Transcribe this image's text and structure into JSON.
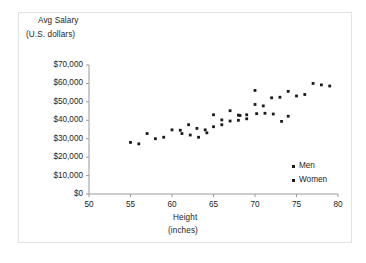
{
  "chart_data": {
    "type": "scatter",
    "title": "",
    "ylabel_line1": "Avg Salary",
    "ylabel_line2": "(U.S. dollars)",
    "xlabel_line1": "Height",
    "xlabel_line2": "(inches)",
    "xlim": [
      50,
      80
    ],
    "ylim": [
      0,
      70000
    ],
    "xticks": [
      50,
      55,
      60,
      65,
      70,
      75,
      80
    ],
    "xtick_labels": [
      "50",
      "55",
      "60",
      "65",
      "70",
      "75",
      "80"
    ],
    "yticks": [
      0,
      10000,
      20000,
      30000,
      40000,
      50000,
      60000,
      70000
    ],
    "ytick_labels": [
      "$0",
      "$10,000",
      "$20,000",
      "$30,000",
      "$40,000",
      "$50,000",
      "$60,000",
      "$70,000"
    ],
    "grid": false,
    "legend_position": "inside-lower-right",
    "marker_color": "#1a1a1a",
    "series": [
      {
        "name": "Men",
        "marker": "diamond",
        "points": [
          [
            65.0,
            43000
          ],
          [
            66.0,
            40200
          ],
          [
            67.0,
            45200
          ],
          [
            68.0,
            42800
          ],
          [
            69.0,
            43000
          ],
          [
            70.0,
            56200
          ],
          [
            70.0,
            48600
          ],
          [
            70.2,
            43600
          ],
          [
            71.0,
            47800
          ],
          [
            71.2,
            43800
          ],
          [
            72.0,
            52200
          ],
          [
            72.2,
            43400
          ],
          [
            73.0,
            52500
          ],
          [
            73.2,
            39400
          ],
          [
            74.0,
            55700
          ],
          [
            75.0,
            53200
          ],
          [
            76.0,
            54000
          ],
          [
            77.0,
            60000
          ],
          [
            78.0,
            59200
          ],
          [
            79.0,
            58600
          ]
        ]
      },
      {
        "name": "Women",
        "marker": "square",
        "points": [
          [
            55.0,
            28000
          ],
          [
            56.0,
            27200
          ],
          [
            57.0,
            32800
          ],
          [
            58.0,
            30000
          ],
          [
            59.0,
            30800
          ],
          [
            60.0,
            34800
          ],
          [
            61.0,
            34600
          ],
          [
            61.2,
            32800
          ],
          [
            62.0,
            37600
          ],
          [
            62.2,
            32000
          ],
          [
            63.0,
            35600
          ],
          [
            63.2,
            30800
          ],
          [
            64.0,
            34800
          ],
          [
            64.2,
            33200
          ],
          [
            65.0,
            36500
          ],
          [
            66.0,
            37600
          ],
          [
            67.0,
            39600
          ],
          [
            68.0,
            40000
          ],
          [
            68.2,
            42600
          ],
          [
            69.0,
            40800
          ],
          [
            74.0,
            42200
          ]
        ]
      }
    ]
  },
  "legend": {
    "items": [
      {
        "label": "Men",
        "marker": "diamond"
      },
      {
        "label": "Women",
        "marker": "square"
      }
    ]
  }
}
